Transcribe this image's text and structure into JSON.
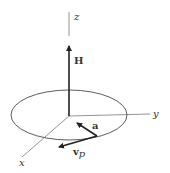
{
  "figure": {
    "axes": {
      "x": {
        "label": "x"
      },
      "y": {
        "label": "y"
      },
      "z": {
        "label": "z"
      }
    },
    "vectors": [
      {
        "id": "H",
        "label": "H",
        "description": "vertical vector along z-axis"
      },
      {
        "id": "a",
        "label": "a",
        "description": "vector pointing toward origin from circle point"
      },
      {
        "id": "vp",
        "label": "v",
        "subscript": "p",
        "description": "vector tangent to circle"
      }
    ],
    "shapes": [
      {
        "type": "ellipse",
        "description": "circular orbit in x-y plane"
      }
    ],
    "colors": {
      "line": "#333333",
      "background": "#ffffff"
    }
  }
}
